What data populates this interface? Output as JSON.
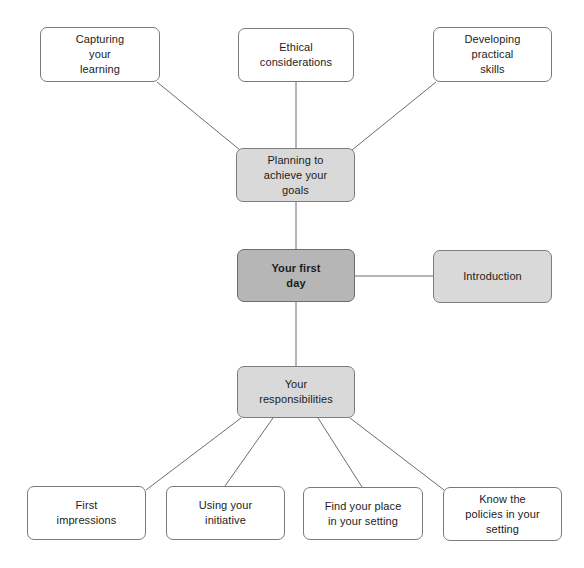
{
  "diagram": {
    "title": "Your first day",
    "type": "mind-map",
    "colors": {
      "background": "#ffffff",
      "node_fill_plain": "#ffffff",
      "node_fill_shaded": "#d9d9d9",
      "node_fill_accent": "#b6b6b6",
      "node_border": "#7a7a7a",
      "connector": "#6d6d6d",
      "text": "#1c1c1c"
    },
    "nodes": [
      {
        "id": "capturing-your-learning",
        "label": "Capturing\nyour\nlearning",
        "style": "plain",
        "x": 40,
        "y": 27,
        "w": 120,
        "h": 55
      },
      {
        "id": "ethical-considerations",
        "label": "Ethical\nconsiderations",
        "style": "plain",
        "x": 238,
        "y": 28,
        "w": 116,
        "h": 54
      },
      {
        "id": "developing-practical-skills",
        "label": "Developing\npractical\nskills",
        "style": "plain",
        "x": 433,
        "y": 27,
        "w": 119,
        "h": 55
      },
      {
        "id": "planning-to-achieve-your-goals",
        "label": "Planning to\nachieve your\ngoals",
        "style": "shaded",
        "x": 236,
        "y": 148,
        "w": 119,
        "h": 54
      },
      {
        "id": "your-first-day",
        "label": "Your first\nday",
        "style": "accent",
        "x": 237,
        "y": 249,
        "w": 118,
        "h": 53
      },
      {
        "id": "introduction",
        "label": "Introduction",
        "style": "shaded",
        "x": 433,
        "y": 250,
        "w": 119,
        "h": 53
      },
      {
        "id": "your-responsibilities",
        "label": "Your\nresponsibilities",
        "style": "shaded",
        "x": 237,
        "y": 366,
        "w": 118,
        "h": 52
      },
      {
        "id": "first-impressions",
        "label": "First\nimpressions",
        "style": "plain",
        "x": 27,
        "y": 486,
        "w": 119,
        "h": 54
      },
      {
        "id": "using-your-initiative",
        "label": "Using your\ninitiative",
        "style": "plain",
        "x": 166,
        "y": 486,
        "w": 119,
        "h": 54
      },
      {
        "id": "find-your-place-in-your-setting",
        "label": "Find your place\nin your setting",
        "style": "plain",
        "x": 303,
        "y": 487,
        "w": 120,
        "h": 53
      },
      {
        "id": "know-the-policies-in-your-setting",
        "label": "Know the\npolicies in your\nsetting",
        "style": "plain",
        "x": 443,
        "y": 487,
        "w": 119,
        "h": 54
      }
    ],
    "connectors": [
      {
        "id": "capturing-to-planning",
        "from": "capturing-your-learning",
        "to": "planning-to-achieve-your-goals",
        "x1": 157,
        "y1": 82,
        "x2": 240,
        "y2": 150
      },
      {
        "id": "ethical-to-planning",
        "from": "ethical-considerations",
        "to": "planning-to-achieve-your-goals",
        "x1": 296,
        "y1": 82,
        "x2": 296,
        "y2": 148
      },
      {
        "id": "developing-to-planning",
        "from": "developing-practical-skills",
        "to": "planning-to-achieve-your-goals",
        "x1": 436,
        "y1": 82,
        "x2": 352,
        "y2": 150
      },
      {
        "id": "planning-to-first-day",
        "from": "planning-to-achieve-your-goals",
        "to": "your-first-day",
        "x1": 296,
        "y1": 202,
        "x2": 296,
        "y2": 249
      },
      {
        "id": "first-day-to-introduction",
        "from": "your-first-day",
        "to": "introduction",
        "x1": 355,
        "y1": 276,
        "x2": 433,
        "y2": 276
      },
      {
        "id": "first-day-to-responsibilities",
        "from": "your-first-day",
        "to": "your-responsibilities",
        "x1": 296,
        "y1": 302,
        "x2": 296,
        "y2": 366
      },
      {
        "id": "responsibilities-to-first-impressions",
        "from": "your-responsibilities",
        "to": "first-impressions",
        "x1": 241,
        "y1": 418,
        "x2": 146,
        "y2": 490
      },
      {
        "id": "responsibilities-to-using-initiative",
        "from": "your-responsibilities",
        "to": "using-your-initiative",
        "x1": 273,
        "y1": 418,
        "x2": 225,
        "y2": 486
      },
      {
        "id": "responsibilities-to-find-your-place",
        "from": "your-responsibilities",
        "to": "find-your-place-in-your-setting",
        "x1": 318,
        "y1": 418,
        "x2": 362,
        "y2": 487
      },
      {
        "id": "responsibilities-to-know-policies",
        "from": "your-responsibilities",
        "to": "know-the-policies-in-your-setting",
        "x1": 350,
        "y1": 418,
        "x2": 444,
        "y2": 490
      }
    ]
  }
}
